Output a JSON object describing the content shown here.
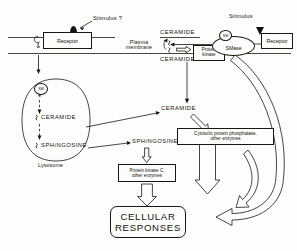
{
  "figure": {
    "domain_note": "sphingomyelin signaling pathway schematic",
    "membrane_label": "Plasma\nmembrane",
    "membrane_label_line1": "Plasma",
    "membrane_label_line2": "membrane"
  },
  "left_pathway": {
    "stimulus_label": "Stimulus ?",
    "receptor_label": "Receptor",
    "organelle_label": "Lysosome",
    "sm_marker": "SM",
    "ceramide_label": "CERAMIDE",
    "sphingosine_label": "SPHiNGOSINE"
  },
  "right_pathway": {
    "stimulus_label": "Stimulus",
    "receptor_label": "Receptor",
    "enzyme_label": "SMase",
    "sm_marker": "SM"
  },
  "membrane_zone": {
    "ceramide_outer_label": "CERAMIDE",
    "ceramide_inner_label": "CERAMIDE",
    "protein_kinase_line1": "Protein",
    "protein_kinase_line2": "kinase"
  },
  "cytosol": {
    "ceramide_label": "CERAMIDE",
    "sphingosine_label": "SPHiNGOSINE",
    "phosphatase_line1": "Cytosolic protein phosphatase,",
    "phosphatase_line2": "other enzymes",
    "kinase_c_line1": "Protein kinase C,",
    "kinase_c_line2": "other enzymes"
  },
  "output": {
    "line1": "CELLULAR",
    "line2": "RESPONSES"
  },
  "colors": {
    "ink": "#15130f",
    "stroke": "#1a1713",
    "paper": "#fdfdfb"
  }
}
